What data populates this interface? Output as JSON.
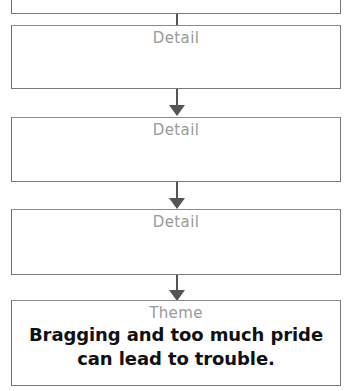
{
  "diagram": {
    "type": "flowchart-vertical-chain",
    "title_visible": false,
    "background_color": "#ffffff",
    "border_color": "#7a7a7a",
    "label_color": "#9a9a9a",
    "text_color": "#111111",
    "arrow_color": "#555555",
    "nodes": [
      {
        "id": "node-partial-top",
        "label": "",
        "body": "",
        "note": "box clipped by top edge of image"
      },
      {
        "id": "node-detail-1",
        "label": "Detail",
        "body": ""
      },
      {
        "id": "node-detail-2",
        "label": "Detail",
        "body": ""
      },
      {
        "id": "node-detail-3",
        "label": "Detail",
        "body": ""
      },
      {
        "id": "node-theme",
        "label": "Theme",
        "body": "Bragging and too much pride can lead to trouble.",
        "body_line_1": "Bragging and too much pride",
        "body_line_2": "can lead to trouble."
      }
    ],
    "connectors": [
      {
        "id": "arrow-1",
        "from": "node-partial-top",
        "to": "node-detail-1",
        "glyph": "down-arrow"
      },
      {
        "id": "arrow-2",
        "from": "node-detail-1",
        "to": "node-detail-2",
        "glyph": "down-arrow"
      },
      {
        "id": "arrow-3",
        "from": "node-detail-2",
        "to": "node-detail-3",
        "glyph": "down-arrow"
      },
      {
        "id": "arrow-4",
        "from": "node-detail-3",
        "to": "node-theme",
        "glyph": "down-arrow"
      }
    ]
  }
}
